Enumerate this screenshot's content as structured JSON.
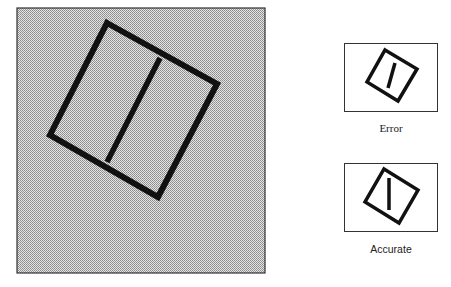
{
  "figure": {
    "main_panel": {
      "description": "large shaded panel with a rotated square divided by an inner line",
      "background": "#c8c8c8",
      "border_color": "#333333"
    },
    "panels": [
      {
        "id": "error",
        "label": "Error"
      },
      {
        "id": "accurate",
        "label": "Accurate"
      }
    ],
    "colors": {
      "stroke": "#111111",
      "panel_bg": "#ffffff",
      "shade": "#c9c9c9"
    }
  }
}
